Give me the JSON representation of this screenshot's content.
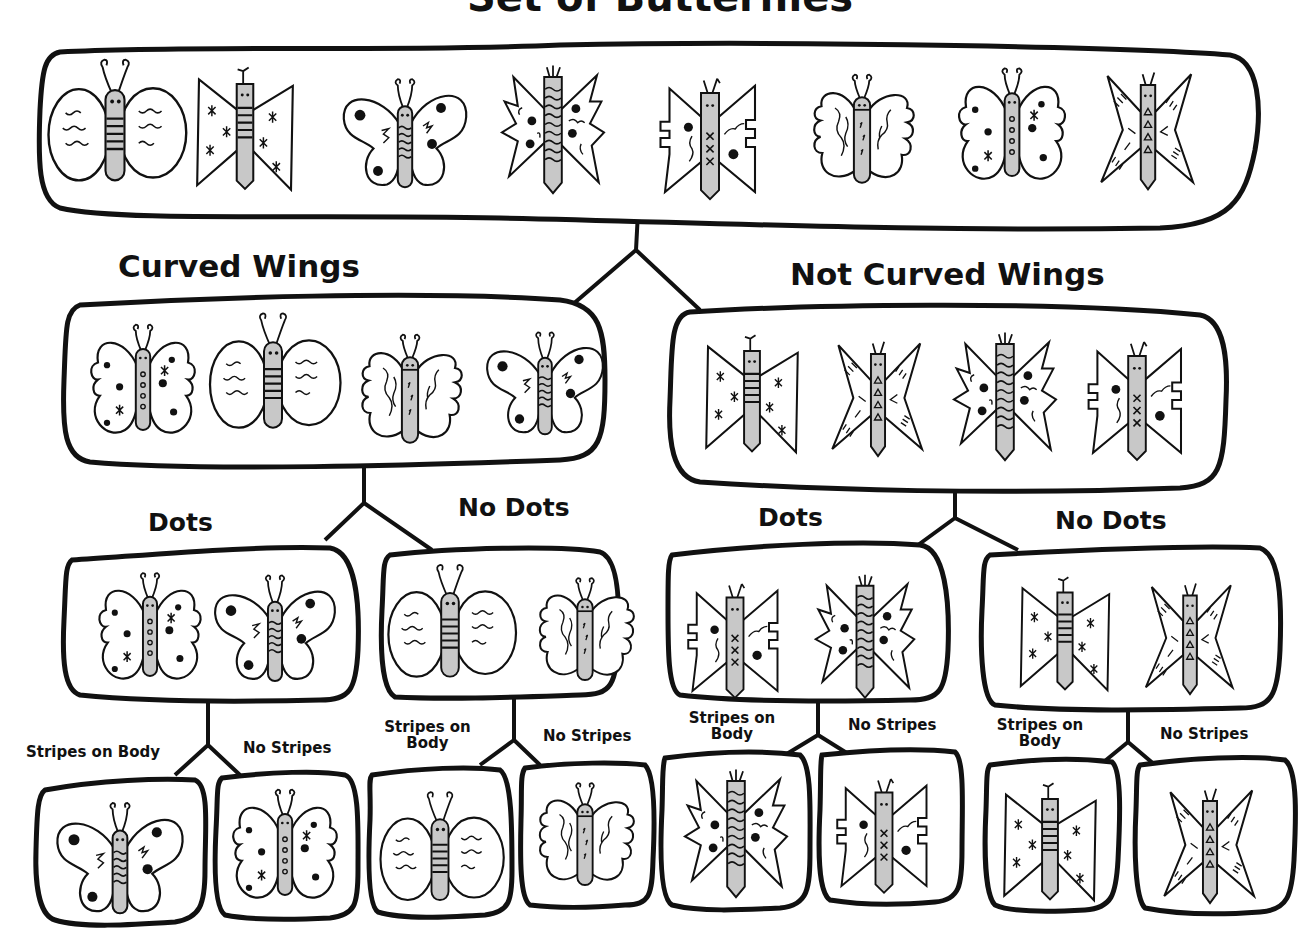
{
  "title": "Set of Butterflies",
  "colors": {
    "ink": "#111111",
    "body_fill": "#c8c8c8",
    "background": "#ffffff"
  },
  "butterfly_types": {
    "A": "oval wings, wavy lines, striped body",
    "B": "triangular wings, stars, striped body",
    "C": "round wings, dots and squiggles, striped body",
    "D": "jagged wings, dots and squiggles, striped body",
    "E": "notched triangular wings, dots, x marks on body",
    "F": "scalloped curved wings, squiggles, plain body",
    "G": "lobed curved wings, dots and stars, dotted body",
    "H": "pointed star wings, dashes, triangles on body"
  },
  "tree": {
    "root": {
      "butterflies": [
        "A",
        "B",
        "C",
        "D",
        "E",
        "F",
        "G",
        "H"
      ]
    },
    "level1": [
      {
        "label": "Curved Wings",
        "butterflies": [
          "G",
          "A",
          "F",
          "C"
        ]
      },
      {
        "label": "Not Curved Wings",
        "butterflies": [
          "B",
          "H",
          "D",
          "E"
        ]
      }
    ],
    "level2": [
      {
        "label": "Dots",
        "butterflies": [
          "G",
          "C"
        ]
      },
      {
        "label": "No Dots",
        "butterflies": [
          "A",
          "F"
        ]
      },
      {
        "label": "Dots",
        "butterflies": [
          "E",
          "D"
        ]
      },
      {
        "label": "No Dots",
        "butterflies": [
          "B",
          "H"
        ]
      }
    ],
    "level3": [
      {
        "label": "Stripes on Body",
        "butterflies": [
          "C"
        ]
      },
      {
        "label": "No Stripes",
        "butterflies": [
          "G"
        ]
      },
      {
        "label": "Stripes on Body",
        "butterflies": [
          "A"
        ]
      },
      {
        "label": "No Stripes",
        "butterflies": [
          "F"
        ]
      },
      {
        "label": "Stripes on Body",
        "butterflies": [
          "D"
        ]
      },
      {
        "label": "No Stripes",
        "butterflies": [
          "E"
        ]
      },
      {
        "label": "Stripes on Body",
        "butterflies": [
          "B"
        ]
      },
      {
        "label": "No Stripes",
        "butterflies": [
          "H"
        ]
      }
    ]
  },
  "labels": {
    "l1_left": "Curved Wings",
    "l1_right": "Not Curved Wings",
    "l2_0": "Dots",
    "l2_1": "No Dots",
    "l2_2": "Dots",
    "l2_3": "No Dots",
    "l3_0": "Stripes on Body",
    "l3_1": "No Stripes",
    "l3_2a": "Stripes on",
    "l3_2b": "Body",
    "l3_3": "No Stripes",
    "l3_4a": "Stripes on",
    "l3_4b": "Body",
    "l3_5": "No Stripes",
    "l3_6a": "Stripes on",
    "l3_6b": "Body",
    "l3_7": "No Stripes"
  }
}
